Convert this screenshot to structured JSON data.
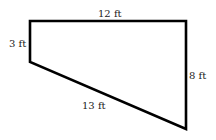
{
  "diagram": {
    "shape": "trapezoid",
    "stroke_color": "#000000",
    "vertices": [
      {
        "name": "top-left",
        "x": 30,
        "y": 21
      },
      {
        "name": "top-right",
        "x": 186,
        "y": 21
      },
      {
        "name": "bottom-right",
        "x": 186,
        "y": 129
      },
      {
        "name": "left-bottom",
        "x": 30,
        "y": 62
      }
    ],
    "labels": {
      "top": "12 ft",
      "left": "3 ft",
      "right": "8 ft",
      "bottom": "13 ft"
    }
  }
}
